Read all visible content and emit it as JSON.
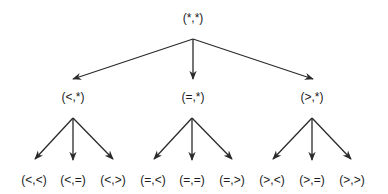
{
  "diagram": {
    "type": "tree",
    "edge_color": "#2a2a2a",
    "text_color": "#1a1a1a",
    "root": {
      "label": "(*,*)",
      "x": 193,
      "y": 18
    },
    "root_apex": {
      "x": 193,
      "y": 39
    },
    "level1": [
      {
        "label": "(<,*)",
        "x": 73,
        "y": 97,
        "tip": {
          "x": 73,
          "y": 79
        },
        "apex": {
          "x": 73,
          "y": 118
        }
      },
      {
        "label": "(=,*)",
        "x": 193,
        "y": 97,
        "tip": {
          "x": 193,
          "y": 79
        },
        "apex": {
          "x": 192,
          "y": 118
        }
      },
      {
        "label": "(>,*)",
        "x": 312,
        "y": 97,
        "tip": {
          "x": 313,
          "y": 79
        },
        "apex": {
          "x": 312,
          "y": 118
        }
      }
    ],
    "leaves": [
      {
        "label": "(<,<)",
        "x": 34,
        "y": 180,
        "tip": {
          "x": 35,
          "y": 159
        },
        "parent": 0
      },
      {
        "label": "(<,=)",
        "x": 73,
        "y": 180,
        "tip": {
          "x": 73,
          "y": 160
        },
        "parent": 0
      },
      {
        "label": "(<,>)",
        "x": 113,
        "y": 180,
        "tip": {
          "x": 113,
          "y": 159
        },
        "parent": 0
      },
      {
        "label": "(=,<)",
        "x": 153,
        "y": 180,
        "tip": {
          "x": 154,
          "y": 159
        },
        "parent": 1
      },
      {
        "label": "(=,=)",
        "x": 192,
        "y": 180,
        "tip": {
          "x": 192,
          "y": 160
        },
        "parent": 1
      },
      {
        "label": "(=,>)",
        "x": 232,
        "y": 180,
        "tip": {
          "x": 232,
          "y": 159
        },
        "parent": 1
      },
      {
        "label": "(>,<)",
        "x": 272,
        "y": 180,
        "tip": {
          "x": 273,
          "y": 159
        },
        "parent": 2
      },
      {
        "label": "(>,=)",
        "x": 312,
        "y": 180,
        "tip": {
          "x": 312,
          "y": 160
        },
        "parent": 2
      },
      {
        "label": "(>,>)",
        "x": 352,
        "y": 180,
        "tip": {
          "x": 351,
          "y": 159
        },
        "parent": 2
      }
    ]
  }
}
